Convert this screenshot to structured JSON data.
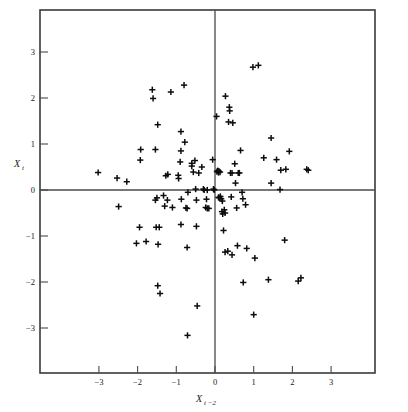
{
  "figure": {
    "background_color": "#ffffff",
    "frame_color": "#3a3a3a",
    "marker_color": "#0d0d0d",
    "axis_line_color": "#4a4a4a"
  },
  "axes": {
    "x_label_main": "X",
    "x_label_sub": "t −2",
    "y_label_main": "X",
    "y_label_sub": "t",
    "x_ticks": [
      "−3",
      "−2",
      "−1",
      "0",
      "1",
      "2",
      "3"
    ],
    "y_ticks": [
      "3",
      "2",
      "1",
      "0",
      "−1",
      "−2",
      "−3"
    ],
    "x_tick_values": [
      -3,
      -2,
      -1,
      0,
      1,
      2,
      3
    ],
    "y_tick_values": [
      3,
      2,
      1,
      0,
      -1,
      -2,
      -3
    ]
  },
  "chart_data": {
    "type": "scatter",
    "title": "",
    "xlabel": "X(t-2)",
    "ylabel": "X(t)",
    "xlim": [
      -3.9,
      3.95
    ],
    "ylim": [
      -3.8,
      3.7
    ],
    "grid": false,
    "legend": null,
    "marker": "plus",
    "n_points": 116,
    "series": [
      {
        "name": "observations",
        "points": [
          [
            -3.02,
            0.38
          ],
          [
            -2.53,
            0.26
          ],
          [
            -2.49,
            -0.36
          ],
          [
            -2.28,
            0.18
          ],
          [
            -1.92,
            0.88
          ],
          [
            -1.93,
            0.65
          ],
          [
            -1.95,
            -0.81
          ],
          [
            -2.03,
            -1.16
          ],
          [
            -1.78,
            -1.12
          ],
          [
            -1.62,
            2.18
          ],
          [
            -1.6,
            1.99
          ],
          [
            -1.54,
            0.88
          ],
          [
            -1.48,
            1.42
          ],
          [
            -1.5,
            -0.17
          ],
          [
            -1.54,
            -0.22
          ],
          [
            -1.52,
            -0.81
          ],
          [
            -1.44,
            -0.81
          ],
          [
            -1.47,
            -1.18
          ],
          [
            -1.48,
            -2.08
          ],
          [
            -1.42,
            -2.25
          ],
          [
            -1.33,
            -0.12
          ],
          [
            -1.27,
            0.31
          ],
          [
            -1.22,
            0.34
          ],
          [
            -1.3,
            -0.35
          ],
          [
            -1.23,
            -0.22
          ],
          [
            -1.14,
            2.13
          ],
          [
            -1.1,
            -0.38
          ],
          [
            -0.95,
            0.32
          ],
          [
            -0.94,
            0.25
          ],
          [
            -0.88,
            1.27
          ],
          [
            -0.88,
            0.85
          ],
          [
            -0.9,
            0.61
          ],
          [
            -0.87,
            -0.2
          ],
          [
            -0.88,
            -0.75
          ],
          [
            -0.8,
            2.28
          ],
          [
            -0.78,
            1.04
          ],
          [
            -0.75,
            -0.39
          ],
          [
            -0.72,
            -0.4
          ],
          [
            -0.7,
            -0.05
          ],
          [
            -0.72,
            -1.25
          ],
          [
            -0.71,
            -3.16
          ],
          [
            -0.6,
            0.58
          ],
          [
            -0.6,
            0.52
          ],
          [
            -0.56,
            0.39
          ],
          [
            -0.52,
            0.64
          ],
          [
            -0.5,
            0.02
          ],
          [
            -0.48,
            -0.22
          ],
          [
            -0.48,
            -0.79
          ],
          [
            -0.46,
            -2.52
          ],
          [
            0.04,
            1.6
          ],
          [
            0.09,
            0.38
          ],
          [
            0.1,
            0.41
          ],
          [
            0.13,
            0.39
          ],
          [
            0.14,
            -0.14
          ],
          [
            0.16,
            -0.19
          ],
          [
            0.19,
            -0.24
          ],
          [
            0.18,
            -0.47
          ],
          [
            0.2,
            -0.52
          ],
          [
            0.22,
            -0.88
          ],
          [
            0.27,
            2.04
          ],
          [
            0.26,
            -1.35
          ],
          [
            0.33,
            -1.33
          ],
          [
            0.35,
            1.48
          ],
          [
            0.37,
            1.8
          ],
          [
            0.38,
            1.72
          ],
          [
            0.4,
            0.37
          ],
          [
            0.44,
            0.37
          ],
          [
            0.42,
            -0.15
          ],
          [
            0.44,
            -1.41
          ],
          [
            0.46,
            1.46
          ],
          [
            0.51,
            0.57
          ],
          [
            0.53,
            0.15
          ],
          [
            0.56,
            -0.39
          ],
          [
            0.58,
            -1.21
          ],
          [
            0.66,
            0.86
          ],
          [
            0.7,
            -0.05
          ],
          [
            0.72,
            -0.19
          ],
          [
            0.73,
            -2.01
          ],
          [
            0.79,
            -0.32
          ],
          [
            0.82,
            -1.27
          ],
          [
            0.98,
            2.67
          ],
          [
            1.03,
            -1.48
          ],
          [
            1.0,
            -2.71
          ],
          [
            1.12,
            2.71
          ],
          [
            1.26,
            0.7
          ],
          [
            1.38,
            -1.95
          ],
          [
            1.45,
            1.13
          ],
          [
            1.45,
            0.15
          ],
          [
            1.59,
            0.66
          ],
          [
            1.7,
            0.43
          ],
          [
            1.68,
            0.01
          ],
          [
            1.8,
            -1.09
          ],
          [
            1.83,
            0.45
          ],
          [
            1.92,
            0.84
          ],
          [
            2.15,
            -1.98
          ],
          [
            2.22,
            -1.91
          ],
          [
            2.37,
            0.45
          ],
          [
            2.41,
            0.43
          ],
          [
            -0.42,
            0.37
          ],
          [
            -0.34,
            0.5
          ],
          [
            -0.3,
            0.02
          ],
          [
            -0.28,
            0.0
          ],
          [
            -0.2,
            0.0
          ],
          [
            -0.22,
            -0.2
          ],
          [
            -0.24,
            -0.38
          ],
          [
            -0.2,
            -0.4
          ],
          [
            -0.16,
            -0.4
          ],
          [
            -0.06,
            0.66
          ],
          [
            -0.04,
            0.02
          ],
          [
            -0.02,
            0.0
          ],
          [
            0.05,
            0.4
          ],
          [
            0.07,
            0.42
          ],
          [
            0.09,
            -0.16
          ],
          [
            0.11,
            -0.17
          ],
          [
            0.24,
            -0.43
          ],
          [
            0.26,
            -0.5
          ],
          [
            0.6,
            0.37
          ],
          [
            0.63,
            0.37
          ]
        ]
      }
    ]
  }
}
